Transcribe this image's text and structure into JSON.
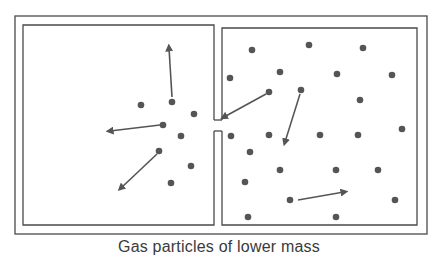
{
  "caption": "Gas particles of lower mass",
  "colors": {
    "line": "#4a4a4a",
    "particle": "#555555",
    "arrow": "#555555",
    "background": "#ffffff"
  },
  "container": {
    "outer": {
      "x": 15,
      "y": 16,
      "w": 412,
      "h": 218
    },
    "left_chamber": {
      "x": 23,
      "y": 25,
      "w": 191,
      "h": 200
    },
    "right_chamber": {
      "x": 222,
      "y": 28,
      "w": 195,
      "h": 197
    },
    "opening": {
      "y1": 120,
      "y2": 131
    }
  },
  "particles": {
    "left": [
      [
        141,
        105
      ],
      [
        172,
        102
      ],
      [
        194,
        114
      ],
      [
        163,
        125
      ],
      [
        181,
        136
      ],
      [
        159,
        151
      ],
      [
        191,
        166
      ],
      [
        171,
        183
      ]
    ],
    "right": [
      [
        252,
        50
      ],
      [
        309,
        45
      ],
      [
        363,
        48
      ],
      [
        230,
        78
      ],
      [
        280,
        72
      ],
      [
        337,
        74
      ],
      [
        392,
        75
      ],
      [
        269,
        92
      ],
      [
        301,
        90
      ],
      [
        360,
        100
      ],
      [
        231,
        136
      ],
      [
        269,
        135
      ],
      [
        320,
        135
      ],
      [
        358,
        135
      ],
      [
        402,
        129
      ],
      [
        250,
        152
      ],
      [
        280,
        170
      ],
      [
        336,
        170
      ],
      [
        378,
        170
      ],
      [
        245,
        182
      ],
      [
        290,
        200
      ],
      [
        395,
        200
      ],
      [
        248,
        217
      ],
      [
        336,
        217
      ]
    ]
  },
  "arrows": [
    {
      "from": [
        172,
        97
      ],
      "to": [
        169,
        48
      ]
    },
    {
      "from": [
        160,
        125
      ],
      "to": [
        110,
        131
      ]
    },
    {
      "from": [
        157,
        154
      ],
      "to": [
        121,
        188
      ]
    },
    {
      "from": [
        266,
        94
      ],
      "to": [
        224,
        117
      ]
    },
    {
      "from": [
        300,
        94
      ],
      "to": [
        285,
        142
      ]
    },
    {
      "from": [
        298,
        200
      ],
      "to": [
        344,
        192
      ]
    }
  ]
}
